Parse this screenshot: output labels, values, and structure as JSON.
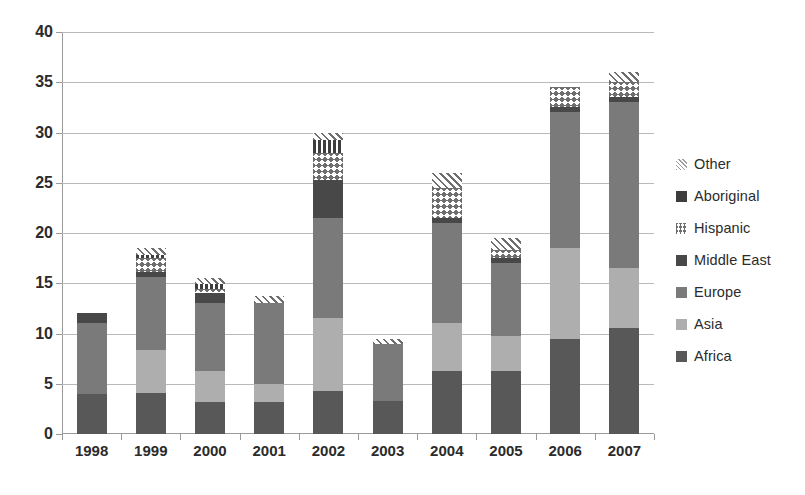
{
  "chart_data": {
    "type": "bar",
    "subtype": "stacked-bar",
    "title": "",
    "xlabel": "",
    "ylabel": "",
    "ylim": [
      0,
      40
    ],
    "ytick_step": 5,
    "ytick_labels": [
      "0",
      "5",
      "10",
      "15",
      "20",
      "25",
      "30",
      "35",
      "40"
    ],
    "grid": true,
    "legend_position": "right",
    "categories": [
      "1998",
      "1999",
      "2000",
      "2001",
      "2002",
      "2003",
      "2004",
      "2005",
      "2006",
      "2007"
    ],
    "series": [
      {
        "name": "Africa",
        "pattern": "solid",
        "color": "#585858",
        "values": [
          4.0,
          4.1,
          3.2,
          3.2,
          4.3,
          3.3,
          6.3,
          6.3,
          9.5,
          10.5
        ]
      },
      {
        "name": "Asia",
        "pattern": "solid",
        "color": "#aeaeae",
        "values": [
          0.0,
          4.3,
          3.1,
          1.8,
          7.2,
          0.0,
          4.7,
          3.5,
          9.0,
          6.0
        ]
      },
      {
        "name": "Europe",
        "pattern": "solid",
        "color": "#7a7a7a",
        "values": [
          7.0,
          7.2,
          6.7,
          8.0,
          10.0,
          5.7,
          10.0,
          7.2,
          13.5,
          16.5
        ]
      },
      {
        "name": "Middle East",
        "pattern": "solid",
        "color": "#484848",
        "values": [
          1.0,
          0.5,
          1.0,
          0.0,
          3.8,
          0.0,
          0.5,
          0.5,
          0.5,
          0.5
        ]
      },
      {
        "name": "Hispanic",
        "pattern": "crosshatch",
        "color": "#6e6e6e",
        "values": [
          0.0,
          1.4,
          0.4,
          0.0,
          2.7,
          0.0,
          3.0,
          0.8,
          2.0,
          1.5
        ]
      },
      {
        "name": "Aboriginal",
        "pattern": "vertical-stripe",
        "color": "#3d3d3d",
        "values": [
          0.0,
          0.3,
          0.5,
          0.0,
          1.3,
          0.0,
          0.0,
          0.0,
          0.0,
          0.0
        ]
      },
      {
        "name": "Other",
        "pattern": "diagonal-hatch",
        "color": "#6e6e6e",
        "values": [
          0.0,
          0.7,
          0.6,
          0.7,
          0.7,
          0.5,
          1.5,
          1.2,
          0.0,
          1.0
        ]
      }
    ],
    "totals": [
      12.0,
      18.0,
      15.5,
      13.7,
      30.0,
      9.5,
      26.0,
      19.5,
      34.5,
      36.0
    ],
    "legend_entries": [
      "Other",
      "Aboriginal",
      "Hispanic",
      "Middle East",
      "Europe",
      "Asia",
      "Africa"
    ]
  },
  "colors": {
    "africa": "#585858",
    "asia": "#aeaeae",
    "europe": "#7a7a7a",
    "middle_east": "#484848",
    "hispanic": "#6e6e6e",
    "aboriginal": "#3d3d3d",
    "other": "#6e6e6e",
    "gridline": "#b9b9b9",
    "axis": "#9a9a9a",
    "text": "#2b2b2b",
    "background": "#ffffff"
  }
}
